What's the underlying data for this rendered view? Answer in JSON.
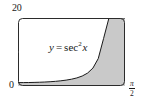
{
  "figure": {
    "name": "area-under-secant-squared",
    "background_color": "#ffffff",
    "frame_color": "#2b2b2b",
    "curve_color": "#1a1a1a",
    "shade_color": "#c9c9c9"
  },
  "labels": {
    "y_max": "20",
    "origin": "0",
    "x_max_numerator": "π",
    "x_max_denominator": "2",
    "equation_lhs": "y",
    "equation_operator": "=",
    "equation_function": "sec",
    "equation_exponent": "2",
    "equation_argument": "x"
  },
  "chart_data": {
    "type": "area",
    "title": "",
    "subtitle": "",
    "xlabel": "",
    "ylabel": "",
    "function": "y = sec^2 x",
    "xlim": [
      0,
      1.5707963
    ],
    "ylim": [
      0,
      20
    ],
    "xtick_labels": [
      "0",
      "π/2"
    ],
    "xtick_values": [
      0,
      1.5707963
    ],
    "ytick_labels": [
      "20"
    ],
    "ytick_values": [
      20
    ],
    "grid": false,
    "legend": false,
    "legend_position": "none",
    "annotations": [
      {
        "text": "y = sec² x",
        "x": 0.72,
        "y": 10.5
      }
    ],
    "shaded_region": {
      "description": "area under y = sec^2 x from x = 0 to x = pi/2",
      "between": [
        "curve",
        "x-axis"
      ],
      "fill": "#c9c9c9",
      "clipped_at_y": 20
    },
    "x": [
      0.0,
      0.0785,
      0.1571,
      0.2356,
      0.3142,
      0.3927,
      0.4712,
      0.5498,
      0.6283,
      0.7069,
      0.7854,
      0.8639,
      0.9425,
      1.021,
      1.0996,
      1.1781,
      1.2566,
      1.3352,
      1.4137,
      1.4451,
      1.4765,
      1.4923,
      1.508,
      1.5159,
      1.5238,
      1.5277,
      1.5317,
      1.5337,
      1.5357,
      1.5366
    ],
    "y": [
      1.0,
      1.006,
      1.025,
      1.058,
      1.106,
      1.172,
      1.26,
      1.375,
      1.528,
      1.733,
      2.0,
      2.375,
      2.928,
      3.793,
      5.263,
      8.07,
      14.0,
      29.86,
      109.2,
      164.7,
      297.1,
      413.1,
      673.7,
      916.5,
      1355.0,
      1680.0,
      2144.0,
      2443.0,
      2819.0,
      3040.0
    ]
  }
}
